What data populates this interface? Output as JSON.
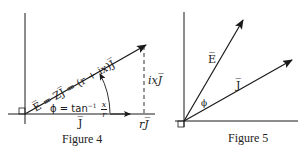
{
  "figures": [
    {
      "caption": "Figure 4",
      "labels": {
        "e_vector": "E̅ = ZJ̅ = (r + ix)J̅",
        "phi_eq_prefix": "ϕ = tan",
        "phi_eq_exp": "−1",
        "phi_frac_num": "x",
        "phi_frac_den": "r",
        "j_axis": "J̅",
        "r_component": "rJ̅",
        "ix_component": "ixJ̅"
      }
    },
    {
      "caption": "Figure 5",
      "labels": {
        "e_vector": "E̅",
        "j_vector": "J̅",
        "phi": "ϕ"
      }
    }
  ],
  "colors": {
    "ink": "#1a1a1a",
    "background": "#ffffff"
  }
}
